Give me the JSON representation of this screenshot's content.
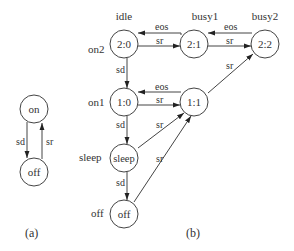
{
  "figure_a": {
    "caption": "(a)",
    "nodes": [
      {
        "id": "on",
        "label": "on"
      },
      {
        "id": "off",
        "label": "off"
      }
    ],
    "edges": [
      {
        "from": "on",
        "to": "off",
        "label": "sd"
      },
      {
        "from": "off",
        "to": "on",
        "label": "sr"
      }
    ]
  },
  "figure_b": {
    "caption": "(b)",
    "row_labels": {
      "on2": "on2",
      "on1": "on1",
      "sleep": "sleep",
      "off": "off"
    },
    "state_labels": {
      "idle": "idle",
      "busy1": "busy1",
      "busy2": "busy2"
    },
    "nodes": [
      {
        "id": "n20",
        "label": "2:0"
      },
      {
        "id": "n21",
        "label": "2:1"
      },
      {
        "id": "n22",
        "label": "2:2"
      },
      {
        "id": "n10",
        "label": "1:0"
      },
      {
        "id": "n11",
        "label": "1:1"
      },
      {
        "id": "nsleep",
        "label": "sleep"
      },
      {
        "id": "noff",
        "label": "off"
      }
    ],
    "edges": [
      {
        "from": "2:1",
        "to": "2:0",
        "label": "eos"
      },
      {
        "from": "2:0",
        "to": "2:1",
        "label": "sr"
      },
      {
        "from": "2:2",
        "to": "2:1",
        "label": "eos"
      },
      {
        "from": "2:1",
        "to": "2:2",
        "label": "sr"
      },
      {
        "from": "2:0",
        "to": "1:0",
        "label": "sd"
      },
      {
        "from": "1:1",
        "to": "1:0",
        "label": "eos"
      },
      {
        "from": "1:0",
        "to": "1:1",
        "label": "sr"
      },
      {
        "from": "1:1",
        "to": "2:2",
        "label": "sr"
      },
      {
        "from": "1:0",
        "to": "sleep",
        "label": "sd"
      },
      {
        "from": "sleep",
        "to": "1:1",
        "label": "sr"
      },
      {
        "from": "sleep",
        "to": "off",
        "label": "sd"
      },
      {
        "from": "off",
        "to": "1:1",
        "label": "sr"
      }
    ]
  }
}
